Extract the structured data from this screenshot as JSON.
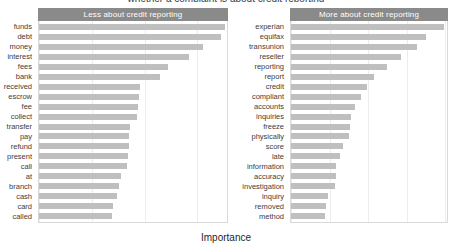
{
  "figure": {
    "suptitle": "whether a complaint is about credit reporting",
    "xlabel": "Importance"
  },
  "chart_data": {
    "type": "bar",
    "orientation": "horizontal",
    "title": "whether a complaint is about credit reporting",
    "xlabel": "Importance",
    "ylabel": "",
    "grid": true,
    "legend": false,
    "facets": [
      {
        "name": "Less about credit reporting",
        "strip_label": "Less about credit reporting",
        "xlim": [
          0,
          17.8
        ],
        "xticks": [
          0,
          5,
          10,
          15
        ],
        "categories": [
          "funds",
          "debt",
          "money",
          "interest",
          "fees",
          "bank",
          "received",
          "escrow",
          "fee",
          "collect",
          "transfer",
          "pay",
          "refund",
          "present",
          "call",
          "at",
          "branch",
          "cash",
          "card",
          "called"
        ],
        "values": [
          17.6,
          17.2,
          15.5,
          14.2,
          12.2,
          11.5,
          9.6,
          9.5,
          9.4,
          9.3,
          8.6,
          8.5,
          8.5,
          8.4,
          8.3,
          7.8,
          7.6,
          7.4,
          7.0,
          6.9
        ]
      },
      {
        "name": "More about credit reporting",
        "strip_label": "More about credit reporting",
        "xlim": [
          0,
          40.5
        ],
        "xticks": [
          0,
          10,
          20,
          30,
          40
        ],
        "categories": [
          "experian",
          "equifax",
          "transunion",
          "reseller",
          "reporting",
          "report",
          "credit",
          "compliant",
          "accounts",
          "inquiries",
          "freeze",
          "physically",
          "score",
          "late",
          "information",
          "accuracy",
          "investigation",
          "inquiry",
          "removed",
          "method"
        ],
        "values": [
          39.8,
          35.0,
          32.7,
          28.5,
          24.8,
          21.5,
          19.7,
          18.2,
          16.6,
          15.6,
          15.2,
          15.1,
          13.6,
          12.6,
          11.8,
          11.7,
          11.5,
          9.5,
          9.0,
          8.8
        ]
      }
    ]
  },
  "style": {
    "strip_bg": "#8a8a8a",
    "strip_fg": "#ffffff",
    "bar_color": "#bfbfbf",
    "grid_color": "#ededed",
    "panel_border": "#d9d9d9"
  }
}
